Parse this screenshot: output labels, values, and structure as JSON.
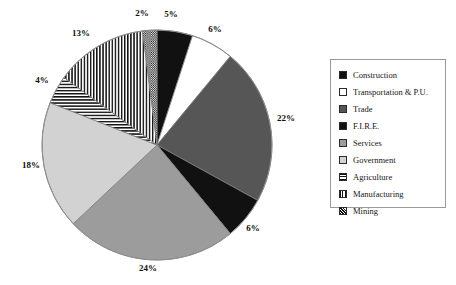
{
  "chart_data": {
    "type": "pie",
    "title": "",
    "subtitle": "",
    "xlabel": "",
    "ylabel": "",
    "grid": false,
    "legend_position": "right",
    "value_suffix": "%",
    "start_angle_deg": 0,
    "direction": "clockwise",
    "categories": [
      "Construction",
      "Transportation & P.U.",
      "Trade",
      "F.I.R.E.",
      "Services",
      "Government",
      "Agriculture",
      "Manufacturing",
      "Mining"
    ],
    "values": [
      5,
      6,
      22,
      6,
      24,
      18,
      4,
      13,
      2
    ],
    "labels": [
      "5%",
      "6%",
      "22%",
      "6%",
      "24%",
      "18%",
      "4%",
      "13%",
      "2%"
    ],
    "slices": [
      {
        "name": "Construction",
        "value": 5,
        "label": "5%",
        "fill": "solid",
        "color": "#111111",
        "label_x": 171,
        "label_y": 14
      },
      {
        "name": "Transportation & P.U.",
        "value": 6,
        "label": "6%",
        "fill": "solid",
        "color": "#ffffff",
        "label_x": 215,
        "label_y": 29
      },
      {
        "name": "Trade",
        "value": 22,
        "label": "22%",
        "fill": "solid",
        "color": "#565656",
        "label_x": 286,
        "label_y": 118
      },
      {
        "name": "F.I.R.E.",
        "value": 6,
        "label": "6%",
        "fill": "solid",
        "color": "#111111",
        "label_x": 253,
        "label_y": 228
      },
      {
        "name": "Services",
        "value": 24,
        "label": "24%",
        "fill": "solid",
        "color": "#9c9c9c",
        "label_x": 148,
        "label_y": 268
      },
      {
        "name": "Government",
        "value": 18,
        "label": "18%",
        "fill": "solid",
        "color": "#d2d2d2",
        "label_x": 31,
        "label_y": 165
      },
      {
        "name": "Agriculture",
        "value": 4,
        "label": "4%",
        "fill": "horizontal-lines",
        "color": "#111111",
        "label_x": 42,
        "label_y": 80
      },
      {
        "name": "Manufacturing",
        "value": 13,
        "label": "13%",
        "fill": "vertical-lines",
        "color": "#111111",
        "label_x": 81,
        "label_y": 33
      },
      {
        "name": "Mining",
        "value": 2,
        "label": "2%",
        "fill": "crosshatch",
        "color": "#111111",
        "label_x": 142,
        "label_y": 13
      }
    ]
  },
  "legend": {
    "items": [
      {
        "label": "Construction",
        "swatch": "black",
        "swatch_class": "sw-black"
      },
      {
        "label": "Transportation & P.U.",
        "swatch": "white",
        "swatch_class": "sw-white"
      },
      {
        "label": "Trade",
        "swatch": "dark-gray",
        "swatch_class": "sw-darkgray"
      },
      {
        "label": "F.I.R.E.",
        "swatch": "black",
        "swatch_class": "sw-black"
      },
      {
        "label": "Services",
        "swatch": "mid-gray",
        "swatch_class": "sw-midgray"
      },
      {
        "label": "Government",
        "swatch": "light-gray",
        "swatch_class": "sw-lightgray"
      },
      {
        "label": "Agriculture",
        "swatch": "horizontal-lines",
        "swatch_class": "sw-hbars"
      },
      {
        "label": "Manufacturing",
        "swatch": "vertical-lines",
        "swatch_class": "sw-vbars"
      },
      {
        "label": "Mining",
        "swatch": "crosshatch",
        "swatch_class": "sw-cross"
      }
    ]
  },
  "geometry": {
    "center_x": 157,
    "center_y": 145,
    "radius": 115
  }
}
